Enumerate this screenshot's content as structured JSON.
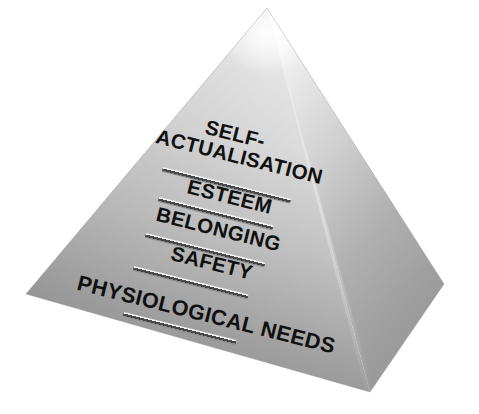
{
  "diagram": {
    "type": "3d-pyramid",
    "background_color": "#ffffff",
    "face_colors": {
      "front_left_top": "#e8e8e8",
      "front_left_bottom": "#8d8d8d",
      "right_top": "#efefef",
      "right_bottom": "#9a9a9a",
      "apex_highlight": "#fcfcfc",
      "label_color": "#101010",
      "divider_dark": "#3f3f3f",
      "divider_highlight": "#f2f2f2"
    },
    "geometry": {
      "apex_x": 267,
      "apex_y": 8,
      "left_corner_x": 26,
      "left_corner_y": 294,
      "front_corner_x": 370,
      "front_corner_y": 392,
      "right_corner_x": 444,
      "right_corner_y": 284,
      "text_rotation_deg": 14
    },
    "tiers": [
      {
        "id": "self-actualisation",
        "level": 5,
        "label": "SELF-ACTUALISATION",
        "line1": "SELF-",
        "line2": "ACTUALISATION",
        "lines": 2
      },
      {
        "id": "esteem",
        "level": 4,
        "label": "ESTEEM",
        "line1": "ESTEEM",
        "lines": 1
      },
      {
        "id": "belonging",
        "level": 3,
        "label": "BELONGING",
        "line1": "BELONGING",
        "lines": 1
      },
      {
        "id": "safety",
        "level": 2,
        "label": "SAFETY",
        "line1": "SAFETY",
        "lines": 1
      },
      {
        "id": "physiological-needs",
        "level": 1,
        "label": "PHYSIOLOGICAL NEEDS",
        "line1": "PHYSIOLOGICAL NEEDS",
        "lines": 1
      }
    ]
  }
}
